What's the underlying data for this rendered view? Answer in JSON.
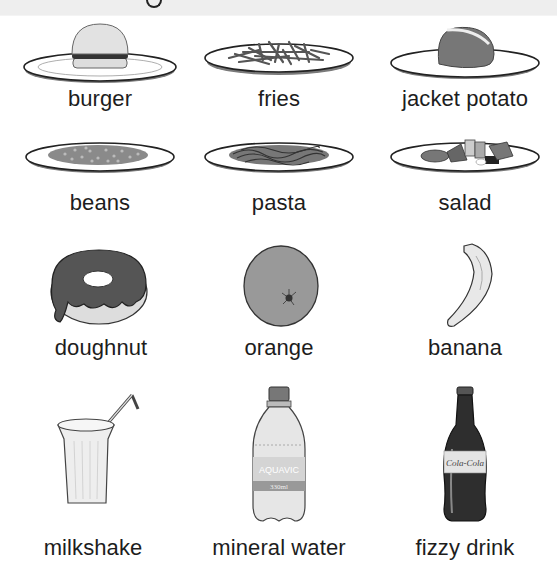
{
  "title": {
    "visible_fragment": "g"
  },
  "items": [
    {
      "label": "burger",
      "icon": "burger-icon"
    },
    {
      "label": "fries",
      "icon": "fries-icon"
    },
    {
      "label": "jacket potato",
      "icon": "jacket-potato-icon"
    },
    {
      "label": "beans",
      "icon": "beans-icon"
    },
    {
      "label": "pasta",
      "icon": "pasta-icon"
    },
    {
      "label": "salad",
      "icon": "salad-icon"
    },
    {
      "label": "doughnut",
      "icon": "doughnut-icon"
    },
    {
      "label": "orange",
      "icon": "orange-icon"
    },
    {
      "label": "banana",
      "icon": "banana-icon"
    },
    {
      "label": "milkshake",
      "icon": "milkshake-icon"
    },
    {
      "label": "mineral water",
      "icon": "mineral-water-icon"
    },
    {
      "label": "fizzy drink",
      "icon": "fizzy-drink-icon"
    }
  ],
  "bottle_labels": {
    "water_brand": "AQUAVIC",
    "water_volume": "330ml",
    "cola_brand": "Cola-Cola"
  }
}
